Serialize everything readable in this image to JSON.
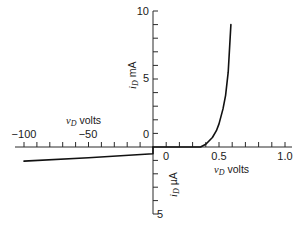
{
  "chart_data": {
    "type": "line",
    "title": "",
    "axes": {
      "x_forward": {
        "label_var": "v",
        "label_sub": "D",
        "label_unit": "volts",
        "range": [
          0,
          1.0
        ],
        "ticks": [
          0,
          0.1,
          0.2,
          0.3,
          0.4,
          0.5,
          0.6,
          0.7,
          0.8,
          0.9,
          1.0
        ],
        "tick_labels": [
          "0",
          "0.5",
          "1.0"
        ]
      },
      "x_reverse": {
        "label_var": "v",
        "label_sub": "D",
        "label_unit": "volts",
        "range": [
          -100,
          0
        ],
        "ticks": [
          -100,
          -90,
          -80,
          -70,
          -60,
          -50,
          -40,
          -30,
          -20,
          -10,
          0
        ],
        "tick_labels": [
          "−100",
          "−50",
          "0"
        ]
      },
      "y_forward": {
        "label_var": "i",
        "label_sub": "D",
        "label_unit": "mA",
        "range": [
          0,
          10
        ],
        "ticks": [
          0,
          1,
          2,
          3,
          4,
          5,
          6,
          7,
          8,
          9,
          10
        ],
        "tick_labels": [
          "0",
          "5",
          "10"
        ]
      },
      "y_reverse": {
        "label_var": "i",
        "label_sub": "D",
        "label_unit": "µA",
        "range": [
          0,
          5
        ],
        "ticks": [
          0,
          1,
          2,
          3,
          4,
          5
        ],
        "tick_labels": [
          "5"
        ]
      }
    },
    "series": [
      {
        "name": "forward bias (mA)",
        "x": [
          0,
          0.1,
          0.2,
          0.3,
          0.36,
          0.4,
          0.45,
          0.48,
          0.5,
          0.53,
          0.55,
          0.57,
          0.59
        ],
        "y": [
          0,
          0,
          0,
          0,
          0,
          0.2,
          0.7,
          1.2,
          1.7,
          2.8,
          3.8,
          5.5,
          9.0
        ]
      },
      {
        "name": "reverse bias (µA, downward)",
        "x": [
          -100,
          -50,
          0
        ],
        "y": [
          -1.05,
          -0.8,
          -0.5
        ]
      }
    ],
    "grid": false,
    "legend": null
  },
  "labels": {
    "y_top_10": "10",
    "y_mid_5": "5",
    "y_zero_mA": "0",
    "y_unit_mA": "mA",
    "y_var": "i",
    "y_sub": "D",
    "x_neg_100": "−100",
    "x_neg_50": "−50",
    "x_zero_right": "0",
    "x_half": "0.5",
    "x_one": "1.0",
    "x_var": "v",
    "x_sub": "D",
    "x_unit": "volts",
    "y_bottom_5": "5",
    "y_unit_uA": "µA"
  }
}
